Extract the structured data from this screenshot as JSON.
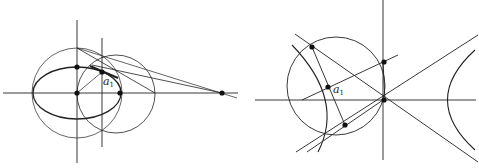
{
  "figures": [
    {
      "name": "ellipse-construction",
      "label": "a",
      "label_subscript": "1",
      "description": "Ellipse with auxiliary circles, tangent lines meeting at external point on the major axis"
    },
    {
      "name": "hyperbola-construction",
      "label": "a",
      "label_subscript": "1",
      "description": "Hyperbola with asymptotes, circle through the center and tangent construction"
    }
  ],
  "colors": {
    "stroke": "#222222",
    "background": "#ffffff"
  }
}
